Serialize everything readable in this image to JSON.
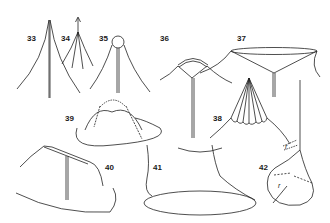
{
  "figure": {
    "type": "line-drawing",
    "labels": [
      {
        "id": "33",
        "x": 27,
        "y": 34
      },
      {
        "id": "34",
        "x": 61,
        "y": 34
      },
      {
        "id": "35",
        "x": 99,
        "y": 34
      },
      {
        "id": "36",
        "x": 160,
        "y": 34
      },
      {
        "id": "37",
        "x": 237,
        "y": 34
      },
      {
        "id": "38",
        "x": 213,
        "y": 114
      },
      {
        "id": "39",
        "x": 65,
        "y": 114
      },
      {
        "id": "40",
        "x": 105,
        "y": 163
      },
      {
        "id": "41",
        "x": 153,
        "y": 163
      },
      {
        "id": "42",
        "x": 259,
        "y": 163
      }
    ],
    "annotations": [
      {
        "text": "r",
        "near": "42",
        "x": 285,
        "y": 147
      },
      {
        "text": "r",
        "near": "42",
        "x": 278,
        "y": 186
      }
    ],
    "stroke_color": "#222222",
    "background": "#ffffff"
  }
}
